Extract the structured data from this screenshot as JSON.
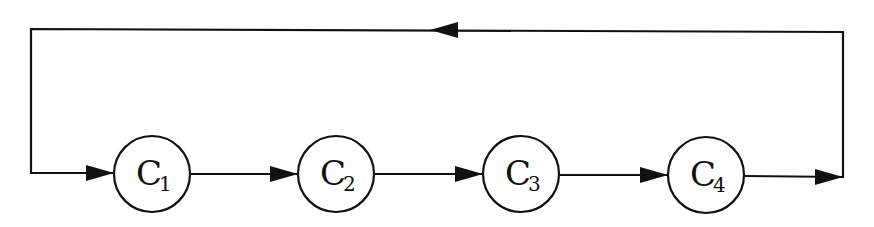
{
  "diagram": {
    "type": "cyclic-flow",
    "nodes": [
      {
        "id": "C1",
        "base": "C",
        "sub": "1",
        "cx": 152,
        "cy": 174
      },
      {
        "id": "C2",
        "base": "C",
        "sub": "2",
        "cx": 336,
        "cy": 174
      },
      {
        "id": "C3",
        "base": "C",
        "sub": "3",
        "cx": 521,
        "cy": 174
      },
      {
        "id": "C4",
        "base": "C",
        "sub": "4",
        "cx": 706,
        "cy": 175
      }
    ],
    "edges": [
      {
        "from": "start",
        "to": "C1"
      },
      {
        "from": "C1",
        "to": "C2"
      },
      {
        "from": "C2",
        "to": "C3"
      },
      {
        "from": "C3",
        "to": "C4"
      },
      {
        "from": "C4",
        "to": "loop-back"
      },
      {
        "from": "loop-back",
        "to": "C1",
        "direction": "feedback via top"
      }
    ],
    "colors": {
      "stroke": "#111111",
      "background": "#ffffff"
    }
  }
}
